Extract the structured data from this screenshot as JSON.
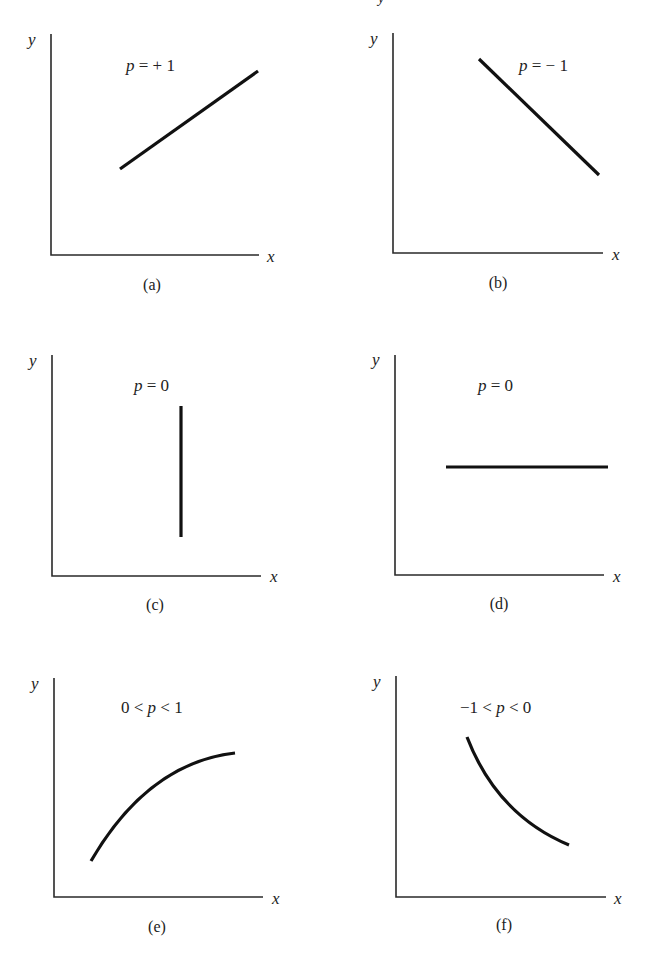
{
  "figure": {
    "clipped_top_glyph": "y",
    "panels": [
      {
        "id": "a",
        "caption": "(a)",
        "relation_prefix": "p",
        "relation_suffix": " = + 1",
        "relation_full": "p = +1",
        "x_axis_label": "x",
        "y_axis_label": "y",
        "shape": "straight line, positive slope"
      },
      {
        "id": "b",
        "caption": "(b)",
        "relation_prefix": "p",
        "relation_suffix": " = − 1",
        "relation_full": "p = −1",
        "x_axis_label": "x",
        "y_axis_label": "y",
        "shape": "straight line, negative slope"
      },
      {
        "id": "c",
        "caption": "(c)",
        "relation_prefix": "p",
        "relation_suffix": " = 0",
        "relation_full": "p = 0",
        "x_axis_label": "x",
        "y_axis_label": "y",
        "shape": "vertical line"
      },
      {
        "id": "d",
        "caption": "(d)",
        "relation_prefix": "p",
        "relation_suffix": " = 0",
        "relation_full": "p = 0",
        "x_axis_label": "x",
        "y_axis_label": "y",
        "shape": "horizontal line"
      },
      {
        "id": "e",
        "caption": "(e)",
        "relation_before": "0 < ",
        "relation_prefix": "p",
        "relation_suffix": " < 1",
        "relation_full": "0 < p < 1",
        "x_axis_label": "x",
        "y_axis_label": "y",
        "shape": "increasing concave curve"
      },
      {
        "id": "f",
        "caption": "(f)",
        "relation_before": "−1 < ",
        "relation_prefix": "p",
        "relation_suffix": " < 0",
        "relation_full": "−1 < p < 0",
        "x_axis_label": "x",
        "y_axis_label": "y",
        "shape": "decreasing convex curve"
      }
    ]
  }
}
